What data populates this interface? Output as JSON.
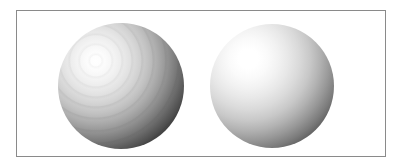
{
  "figure": {
    "caption": "",
    "width_px": 403,
    "height_px": 168,
    "background_color": "#ffffff",
    "frame": {
      "name": "border-rectangle",
      "color": "#8a8a8a",
      "stroke_width_px": 1,
      "left_px": 16,
      "top_px": 10,
      "width_px": 370,
      "height_px": 147
    },
    "objects": [
      {
        "name": "sphere-left",
        "label": "",
        "shading": "banded",
        "center_x_px": 120,
        "center_y_px": 85,
        "radius_px": 63,
        "highlight_x_px": 95,
        "highlight_y_px": 60,
        "highlight_color": "#ffffff",
        "terminator_color": "#101010",
        "midtone_color": "#ababab",
        "artifact": "concentric-rings"
      },
      {
        "name": "sphere-right",
        "label": "",
        "shading": "smooth",
        "center_x_px": 271,
        "center_y_px": 85,
        "radius_px": 62,
        "highlight_x_px": 248,
        "highlight_y_px": 58,
        "highlight_color": "#ffffff",
        "terminator_color": "#121212",
        "midtone_color": "#c8c8c8",
        "artifact": "none"
      }
    ]
  }
}
